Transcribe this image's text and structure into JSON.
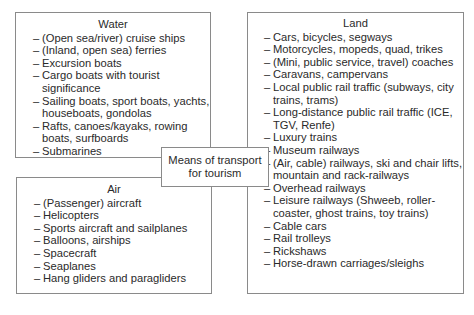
{
  "center": {
    "line1": "Means of transport",
    "line2": "for tourism"
  },
  "water": {
    "title": "Water",
    "items": [
      "(Open sea/river) cruise ships",
      "(Inland, open sea) ferries",
      "Excursion boats",
      "Cargo boats with tourist significance",
      "Sailing boats, sport boats, yachts, houseboats, gondolas",
      "Rafts, canoes/kayaks, rowing boats, surfboards",
      "Submarines"
    ]
  },
  "air": {
    "title": "Air",
    "items": [
      "(Passenger) aircraft",
      "Helicopters",
      "Sports aircraft and sailplanes",
      "Balloons, airships",
      "Spacecraft",
      "Seaplanes",
      "Hang gliders and paragliders"
    ]
  },
  "land": {
    "title": "Land",
    "items": [
      "Cars, bicycles, segways",
      "Motorcycles, mopeds, quad, trikes",
      "(Mini, public service, travel) coaches",
      "Caravans, campervans",
      "Local public rail traffic (subways, city trains, trams)",
      "Long-distance public rail traffic (ICE, TGV, Renfe)",
      "Luxury trains",
      "Museum railways",
      "(Air, cable) railways, ski and chair lifts, mountain and rack-railways",
      "Overhead railways",
      "Leisure railways (Shweeb, roller-coaster, ghost trains, toy trains)",
      "Cable cars",
      "Rail trolleys",
      "Rickshaws",
      "Horse-drawn carriages/sleighs"
    ]
  },
  "dash": "–"
}
